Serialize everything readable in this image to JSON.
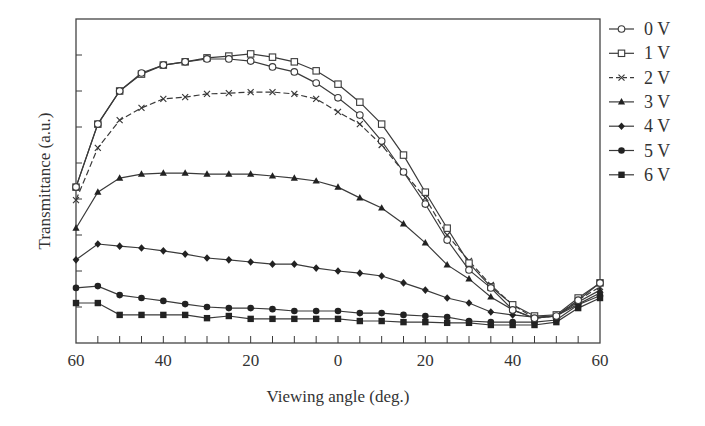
{
  "chart_data": {
    "type": "line",
    "title": "",
    "xlabel": "Viewing angle (deg.)",
    "ylabel": "Transmittance (a.u.)",
    "x": [
      -60,
      -55,
      -50,
      -45,
      -40,
      -35,
      -30,
      -25,
      -20,
      -15,
      -10,
      -5,
      0,
      5,
      10,
      15,
      20,
      25,
      30,
      35,
      40,
      45,
      50,
      55,
      60
    ],
    "x_tick_labels": [
      "60",
      "40",
      "20",
      "0",
      "20",
      "40",
      "60"
    ],
    "x_tick_values": [
      -60,
      -40,
      -20,
      0,
      20,
      40,
      60
    ],
    "xlim": [
      -60,
      60
    ],
    "ylim": [
      0,
      9
    ],
    "y_ticks_unlabeled": [
      1,
      2,
      3,
      4,
      5,
      6,
      7,
      8
    ],
    "grid": false,
    "legend_position": "right-outside",
    "series": [
      {
        "name": "0 V",
        "marker": "circle-open",
        "dash": "solid",
        "values": [
          4.33,
          6.08,
          7.0,
          7.5,
          7.72,
          7.81,
          7.89,
          7.89,
          7.83,
          7.67,
          7.53,
          7.22,
          6.81,
          6.33,
          5.61,
          4.75,
          3.86,
          2.86,
          2.03,
          1.53,
          0.92,
          0.69,
          0.75,
          1.19,
          1.67
        ]
      },
      {
        "name": "1 V",
        "marker": "square-open",
        "dash": "solid",
        "values": [
          4.33,
          6.08,
          7.0,
          7.47,
          7.72,
          7.81,
          7.92,
          7.97,
          8.03,
          7.94,
          7.81,
          7.56,
          7.19,
          6.69,
          6.08,
          5.22,
          4.19,
          3.19,
          2.22,
          1.56,
          1.06,
          0.75,
          0.78,
          1.25,
          1.67
        ]
      },
      {
        "name": "2 V",
        "marker": "x",
        "dash": "dashed",
        "values": [
          3.97,
          5.42,
          6.19,
          6.53,
          6.78,
          6.83,
          6.92,
          6.94,
          6.97,
          6.97,
          6.92,
          6.78,
          6.42,
          6.08,
          5.5,
          4.75,
          4.03,
          3.0,
          2.28,
          1.61,
          1.06,
          0.69,
          0.75,
          1.19,
          1.56
        ]
      },
      {
        "name": "3 V",
        "marker": "triangle-filled",
        "dash": "solid",
        "values": [
          3.19,
          4.19,
          4.58,
          4.69,
          4.72,
          4.72,
          4.69,
          4.69,
          4.69,
          4.64,
          4.58,
          4.5,
          4.33,
          4.03,
          3.75,
          3.31,
          2.78,
          2.17,
          1.78,
          1.28,
          0.92,
          0.69,
          0.75,
          1.14,
          1.47
        ]
      },
      {
        "name": "4 V",
        "marker": "diamond-filled",
        "dash": "solid",
        "values": [
          2.31,
          2.75,
          2.69,
          2.64,
          2.56,
          2.47,
          2.36,
          2.31,
          2.25,
          2.19,
          2.19,
          2.08,
          2.0,
          1.94,
          1.86,
          1.67,
          1.47,
          1.25,
          1.11,
          0.86,
          0.78,
          0.72,
          0.75,
          1.08,
          1.39
        ]
      },
      {
        "name": "5 V",
        "marker": "hexagon-filled",
        "dash": "solid",
        "values": [
          1.53,
          1.58,
          1.33,
          1.25,
          1.17,
          1.08,
          1.0,
          0.97,
          0.97,
          0.94,
          0.89,
          0.89,
          0.89,
          0.83,
          0.83,
          0.78,
          0.75,
          0.72,
          0.61,
          0.58,
          0.58,
          0.58,
          0.64,
          1.06,
          1.31
        ]
      },
      {
        "name": "6 V",
        "marker": "square-filled",
        "dash": "solid",
        "values": [
          1.11,
          1.11,
          0.78,
          0.78,
          0.78,
          0.78,
          0.69,
          0.75,
          0.67,
          0.67,
          0.67,
          0.67,
          0.67,
          0.61,
          0.61,
          0.58,
          0.58,
          0.56,
          0.56,
          0.5,
          0.5,
          0.5,
          0.58,
          0.97,
          1.25
        ]
      }
    ]
  },
  "legend": {
    "items": [
      {
        "label": "0 V"
      },
      {
        "label": "1 V"
      },
      {
        "label": "2 V"
      },
      {
        "label": "3 V"
      },
      {
        "label": "4 V"
      },
      {
        "label": "5 V"
      },
      {
        "label": "6 V"
      }
    ]
  },
  "axes": {
    "xlabel": "Viewing angle (deg.)",
    "ylabel": "Transmittance (a.u.)"
  }
}
